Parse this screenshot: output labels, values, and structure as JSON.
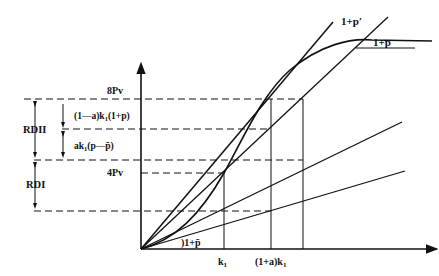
{
  "diagram": {
    "axes": {
      "y_axis": "vertical axis with arrow",
      "x_axis": "horizontal axis with arrow"
    },
    "curve_labels": {
      "steep_line": "1+p′",
      "curve_top": "1+p",
      "bottom_line": "1+p̄"
    },
    "y_levels": {
      "top": "8Pv",
      "mid": "4Pv"
    },
    "x_ticks": {
      "k1": "k",
      "k1_sub": "1",
      "ak1_prefix": "(1+a)k",
      "ak1_sub": "1"
    },
    "brackets": {
      "rd2": "RDII",
      "rd1": "RDI",
      "upper_term_a": "(1—a)k",
      "upper_term_sub": "1",
      "upper_term_b": "(1+p)",
      "lower_term_a": "ak",
      "lower_term_sub": "1",
      "lower_term_b": "(p—p̄)"
    }
  }
}
